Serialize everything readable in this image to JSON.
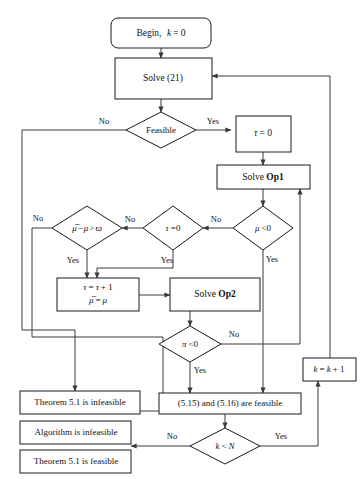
{
  "figure": {
    "type": "flowchart",
    "background_color": "#ffffff",
    "line_color": "#3a3a3a",
    "node_fill": "#ffffff",
    "node_stroke": "#1a1a1a"
  },
  "nodes": {
    "begin": {
      "label": "Begin,  k = 0",
      "text_main": "Begin,",
      "text_math": "k",
      "text_rest": "= 0",
      "shape": "rounded-rectangle"
    },
    "solve21": {
      "label": "Solve (21)",
      "shape": "rectangle"
    },
    "feasible": {
      "label": "Feasible",
      "shape": "diamond"
    },
    "tau_zero_assign": {
      "label": "τ = 0",
      "shape": "rectangle"
    },
    "solve_op1": {
      "label": "Solve Op1",
      "text_main": "Solve",
      "text_bold": "Op1",
      "shape": "rectangle"
    },
    "mu_neg": {
      "label": "μ < 0",
      "shape": "diamond"
    },
    "tau_eq_zero": {
      "label": "τ = 0",
      "shape": "diamond"
    },
    "mubar_diff": {
      "label": "μ̅ − μ > ϖ",
      "shape": "diamond"
    },
    "tau_increment": {
      "line1": "τ = τ + 1",
      "line2": "μ̅ = μ",
      "shape": "rectangle"
    },
    "solve_op2": {
      "label": "Solve Op2",
      "text_main": "Solve",
      "text_bold": "Op2",
      "shape": "rectangle"
    },
    "pi_neg": {
      "label": "π < 0",
      "shape": "diamond"
    },
    "theorem_infeasible": {
      "label": "Theorem 5.1 is infeasible",
      "shape": "rectangle"
    },
    "algorithm_infeasible": {
      "label": "Algorithm is infeasible",
      "shape": "rectangle"
    },
    "theorem_feasible": {
      "label": "Theorem 5.1 is feasible",
      "shape": "rectangle"
    },
    "conditions_feasible": {
      "label": "(5.15) and (5.16) are feasible",
      "shape": "rectangle"
    },
    "k_increment": {
      "label": "k = k + 1",
      "shape": "rectangle"
    },
    "k_less_n": {
      "label": "k < N",
      "shape": "diamond"
    }
  },
  "edge_labels": {
    "feasible_no": "No",
    "feasible_yes": "Yes",
    "mu_neg_no": "No",
    "mu_neg_yes": "Yes",
    "tau_eq_zero_no": "No",
    "tau_eq_zero_yes": "Yes",
    "mubar_diff_no": "No",
    "mubar_diff_yes": "Yes",
    "pi_neg_no": "No",
    "pi_neg_yes": "Yes",
    "k_less_n_no": "No",
    "k_less_n_yes": "Yes"
  }
}
